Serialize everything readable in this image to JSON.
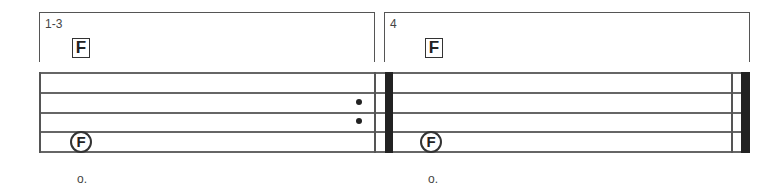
{
  "score": {
    "sections": [
      {
        "measure_label": "1-3",
        "rehearsal_mark": "F",
        "note_label": "F",
        "under_text": "o."
      },
      {
        "measure_label": "4",
        "rehearsal_mark": "F",
        "note_label": "F",
        "under_text": "o."
      }
    ],
    "repeat_sign": "end-repeat",
    "final_barline": "final-barline",
    "colors": {
      "ink": "#222222",
      "lines": "#666666"
    }
  }
}
